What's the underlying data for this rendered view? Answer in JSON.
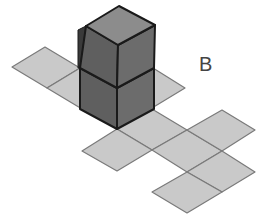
{
  "figure": {
    "label": "B",
    "label_pos": {
      "x": 199,
      "y": 54
    },
    "colors": {
      "tile_fill": "#c9c9c9",
      "tile_stroke": "#7a7a7a",
      "cube_top": "#8c8c8c",
      "cube_left": "#5f5f5f",
      "cube_right": "#6c6c6c",
      "cube_stroke": "#1a1a1a",
      "shadow": "#3a3a3a"
    },
    "tiles": [
      {
        "name": "tile-left-1",
        "points": "12,67 45,47 80,68 47,88"
      },
      {
        "name": "tile-left-2",
        "points": "47,88 80,68 117,88 82,109"
      },
      {
        "name": "tile-right-of-cube",
        "points": "117,88 153,68 185,88 152,108"
      },
      {
        "name": "tile-below-cube",
        "points": "117,129 152,109 187,130 152,150"
      },
      {
        "name": "tile-front-left",
        "points": "82,151 117,129 152,150 117,171"
      },
      {
        "name": "tile-center",
        "points": "152,150 187,130 222,151 187,172"
      },
      {
        "name": "tile-far-right-top",
        "points": "187,130 222,110 255,130 222,151"
      },
      {
        "name": "tile-right-lower",
        "points": "187,172 222,151 255,172 222,192"
      },
      {
        "name": "tile-bottom",
        "points": "152,192 187,172 222,192 187,213"
      }
    ],
    "cubes": [
      {
        "name": "cube-bottom",
        "left": "80,68 117,88 117,129 80,109",
        "right": "117,88 154,68 154,109 117,129"
      },
      {
        "name": "cube-top",
        "top": "86,26 119,6 155,25 118,45",
        "left": "86,26 118,45 117,88 80,68",
        "right": "118,45 155,25 154,68 117,88",
        "shadow": "78,30 86,26 80,68 78,68"
      }
    ]
  }
}
